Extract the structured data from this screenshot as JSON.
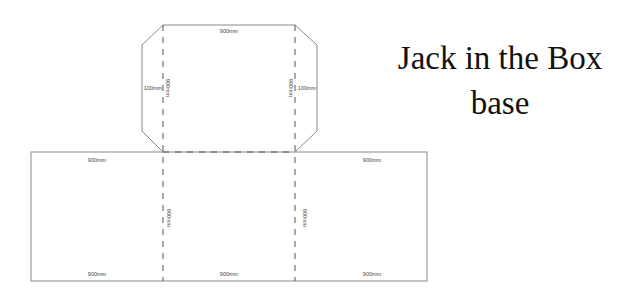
{
  "title": {
    "line1": "Jack in the Box",
    "line2": "base"
  },
  "diagram": {
    "top_flap": {
      "top_width_label": "900mm",
      "left_tab_label": "100mm",
      "right_tab_label": "100mm",
      "left_fold_height_label": "900mm",
      "right_fold_height_label": "900mm"
    },
    "base": {
      "top_left_label": "900mm",
      "top_right_label": "900mm",
      "bottom_left_label": "900mm",
      "bottom_center_label": "900mm",
      "bottom_right_label": "900mm",
      "left_fold_height_label": "900mm",
      "right_fold_height_label": "900mm"
    },
    "colors": {
      "cut_line": "#8a8a8a",
      "fold_line": "#555555",
      "text": "#444444"
    }
  }
}
